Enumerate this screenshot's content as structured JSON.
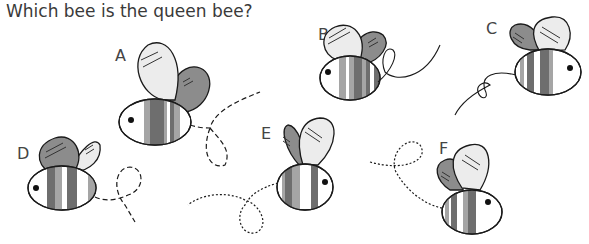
{
  "question": "Which bee is the queen bee?",
  "bees": [
    {
      "label": "A"
    },
    {
      "label": "B"
    },
    {
      "label": "C"
    },
    {
      "label": "D"
    },
    {
      "label": "E"
    },
    {
      "label": "F"
    }
  ],
  "colors": {
    "light_wing": "#ececec",
    "dark_wing": "#8c8c8c",
    "stripe_dark": "#6e6e6e",
    "stripe_mid": "#a5a5a5",
    "outline": "#1a1a1a"
  }
}
